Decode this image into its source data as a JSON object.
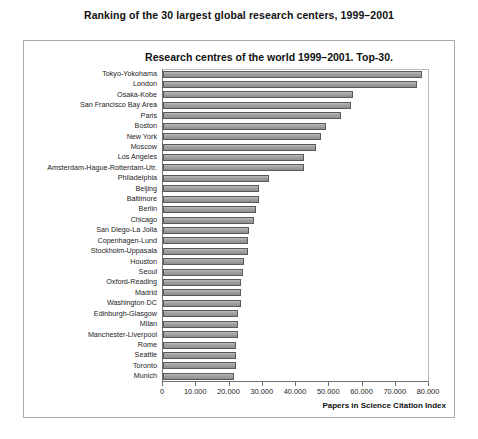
{
  "page": {
    "title": "Ranking of the 30 largest global research centers, 1999–2001"
  },
  "chart_data": {
    "type": "bar",
    "orientation": "horizontal",
    "title": "Research centres of the world 1999–2001. Top-30.",
    "xlabel": "Papers in Science Citation Index",
    "ylabel": "",
    "xlim": [
      0,
      80000
    ],
    "grid": false,
    "legend": null,
    "bar_color": "#9e9e9e",
    "bar_border_color": "#59595f",
    "xticks": [
      0,
      10000,
      20000,
      30000,
      40000,
      50000,
      60000,
      70000,
      80000
    ],
    "xtick_labels": [
      "0",
      "10.000",
      "20.000",
      "30.000",
      "40.000",
      "50.000",
      "60.000",
      "70.000",
      "80.000"
    ],
    "categories": [
      "Tokyo-Yokohama",
      "London",
      "Osaka-Kobe",
      "San Francisco Bay Area",
      "Paris",
      "Boston",
      "New York",
      "Moscow",
      "Los Angeles",
      "Amsterdam-Hague-Rotterdam-Utr.",
      "Philadelphia",
      "Beijing",
      "Baltimore",
      "Berlin",
      "Chicago",
      "San Diego-La Jolla",
      "Copenhagen-Lund",
      "Stockholm-Uppasala",
      "Houston",
      "Seoul",
      "Oxford-Reading",
      "Madrid",
      "Washington DC",
      "Edinburgh-Glasgow",
      "Milan",
      "Manchester-Liverpool",
      "Rome",
      "Seattle",
      "Toronto",
      "Munich"
    ],
    "values": [
      78000,
      76500,
      57000,
      56500,
      53500,
      49000,
      47500,
      46000,
      42500,
      42500,
      32000,
      29000,
      29000,
      28000,
      27500,
      26000,
      25500,
      25500,
      24500,
      24000,
      23500,
      23500,
      23500,
      22500,
      22500,
      22500,
      22000,
      22000,
      22000,
      21500
    ]
  }
}
